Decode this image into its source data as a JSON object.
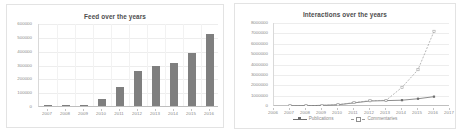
{
  "charts": {
    "feed": {
      "title": "Feed over the years",
      "ylabels": [
        "600000",
        "500000",
        "400000",
        "300000",
        "200000",
        "100000",
        "0"
      ],
      "xlabels": [
        "2007",
        "2008",
        "2009",
        "2010",
        "2011",
        "2012",
        "2013",
        "2014",
        "2015",
        "2016"
      ],
      "bar_color": "#7f7f7f"
    },
    "interactions": {
      "title": "Interactions over the years",
      "ylabels": [
        "8000000",
        "7000000",
        "6000000",
        "5000000",
        "4000000",
        "3000000",
        "2000000",
        "1000000",
        "0"
      ],
      "xlabels": [
        "2006",
        "2007",
        "2008",
        "2009",
        "2010",
        "2011",
        "2012",
        "2013",
        "2014",
        "2015",
        "2016",
        "2017"
      ],
      "legend": [
        {
          "label": "Publications",
          "style": "solid-filled-marker",
          "color": "#6e6e6e"
        },
        {
          "label": "Commentaries",
          "style": "dashed-open-marker",
          "color": "#9a9a9a"
        }
      ]
    }
  },
  "chart_data": [
    {
      "type": "bar",
      "title": "Feed over the years",
      "xlabel": "",
      "ylabel": "",
      "categories": [
        "2007",
        "2008",
        "2009",
        "2010",
        "2011",
        "2012",
        "2013",
        "2014",
        "2015",
        "2016"
      ],
      "values": [
        2000,
        3000,
        10000,
        50000,
        135000,
        250000,
        290000,
        310000,
        385000,
        520000
      ],
      "ylim": [
        0,
        600000
      ],
      "yticks": [
        0,
        100000,
        200000,
        300000,
        400000,
        500000,
        600000
      ],
      "grid": true,
      "legend": "none",
      "bar_color": "#7f7f7f"
    },
    {
      "type": "line",
      "title": "Interactions over the years",
      "xlabel": "",
      "ylabel": "",
      "x": [
        "2006",
        "2007",
        "2008",
        "2009",
        "2010",
        "2011",
        "2012",
        "2013",
        "2014",
        "2015",
        "2016",
        "2017"
      ],
      "series": [
        {
          "name": "Publications",
          "values": [
            null,
            20000,
            30000,
            60000,
            120000,
            300000,
            480000,
            520000,
            560000,
            700000,
            900000,
            null
          ]
        },
        {
          "name": "Commentaries",
          "values": [
            null,
            20000,
            30000,
            60000,
            120000,
            330000,
            520000,
            540000,
            1800000,
            3500000,
            7200000,
            null
          ]
        }
      ],
      "ylim": [
        0,
        8000000
      ],
      "yticks": [
        0,
        1000000,
        2000000,
        3000000,
        4000000,
        5000000,
        6000000,
        7000000,
        8000000
      ],
      "grid": true,
      "legend_position": "bottom"
    }
  ]
}
